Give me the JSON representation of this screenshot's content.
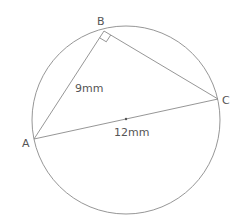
{
  "diagram": {
    "type": "circle-inscribed-right-triangle",
    "vertices": {
      "A": {
        "label": "A"
      },
      "B": {
        "label": "B",
        "right_angle": true
      },
      "C": {
        "label": "C"
      }
    },
    "measurements": {
      "AB": "9mm",
      "AC": "12mm"
    }
  },
  "colors": {
    "line": "#8a8a8a",
    "text": "#555555",
    "background": "#ffffff"
  }
}
